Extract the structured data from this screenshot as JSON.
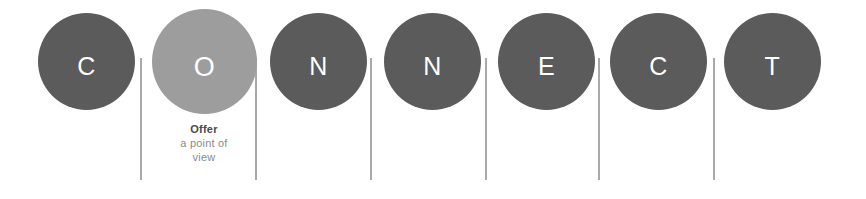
{
  "diagram": {
    "acronym": "CONNECT",
    "colors": {
      "circle_default": "#5b5b5b",
      "circle_highlight": "#9d9d9d",
      "letter": "#ffffff",
      "separator": "#9a9a9a",
      "caption_title": "#4a4a4a",
      "caption_sub": "#8a8a8a",
      "background": "#ffffff"
    },
    "steps": [
      {
        "letter": "C",
        "highlighted": false,
        "left": 38
      },
      {
        "letter": "O",
        "highlighted": true,
        "left": 156
      },
      {
        "letter": "N",
        "highlighted": false,
        "left": 270
      },
      {
        "letter": "N",
        "highlighted": false,
        "left": 384
      },
      {
        "letter": "E",
        "highlighted": false,
        "left": 498
      },
      {
        "letter": "C",
        "highlighted": false,
        "left": 610
      },
      {
        "letter": "T",
        "highlighted": false,
        "left": 724
      }
    ],
    "separators": [
      {
        "left": 140,
        "top": 58,
        "height": 122
      },
      {
        "left": 255,
        "top": 58,
        "height": 122
      },
      {
        "left": 370,
        "top": 58,
        "height": 122
      },
      {
        "left": 485,
        "top": 58,
        "height": 122
      },
      {
        "left": 598,
        "top": 58,
        "height": 122
      },
      {
        "left": 713,
        "top": 58,
        "height": 122
      }
    ],
    "caption": {
      "for_step_index": 1,
      "left": 139,
      "title": "Offer",
      "line1": "a point of",
      "line2": "view"
    }
  }
}
